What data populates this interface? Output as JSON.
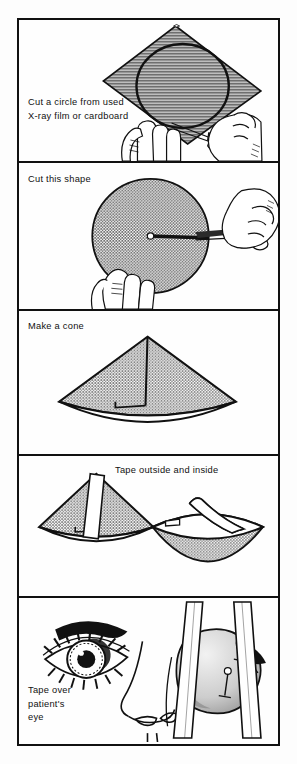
{
  "document": {
    "title": "How to make an eye shield",
    "panel_count": 5,
    "ink_color": "#111111",
    "fill_gray": "#8d8d8d",
    "paper_color": "#fdfdfd"
  },
  "panels": [
    {
      "index": 1,
      "caption": "Cut a circle from used\nX-ray film or cardboard",
      "illustration": "hands-cutting-square-of-xray-film-with-scissors-circle-drawn-on-it"
    },
    {
      "index": 2,
      "caption": "Cut this shape",
      "illustration": "hand-holding-gray-disc-with-scissors-cutting-radial-slit-to-centre"
    },
    {
      "index": 3,
      "caption": "Make a cone",
      "illustration": "gray-cone-formed-from-slit-disc-with-overlapping-edge"
    },
    {
      "index": 4,
      "caption": "Tape outside and inside",
      "illustration": "cone-seen-from-outside-with-tape-strip-and-cone-seen-from-inside-with-tape-strip"
    },
    {
      "index": 5,
      "caption": "Tape over\npatient's\neye",
      "illustration": "face-with-open-eye-beside-nose-and-cone-shield-taped-over-other-eye-with-two-tape-strips"
    }
  ]
}
